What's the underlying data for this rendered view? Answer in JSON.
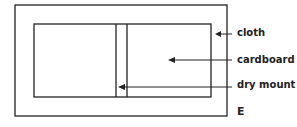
{
  "labels": {
    "cloth": "cloth",
    "cardboard": "cardboard",
    "dry_mount": "dry mount",
    "figure_letter": "E"
  },
  "colors": {
    "line": "#222222",
    "background": "#ffffff"
  }
}
